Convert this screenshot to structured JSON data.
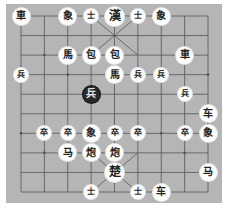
{
  "board": {
    "type": "xiangqi",
    "columns": 9,
    "rows": 10,
    "colors": {
      "board": "#b5b5b5",
      "lines": "#555555",
      "piece_light": "#ffffff",
      "piece_dark": "#2a2a2a"
    }
  },
  "pieces": [
    {
      "label": "車",
      "col": 0,
      "row": 0,
      "style": "normal"
    },
    {
      "label": "象",
      "col": 2,
      "row": 0,
      "style": "normal"
    },
    {
      "label": "士",
      "col": 3,
      "row": 0,
      "style": "small"
    },
    {
      "label": "漢",
      "col": 4,
      "row": 0,
      "style": "big"
    },
    {
      "label": "士",
      "col": 5,
      "row": 0,
      "style": "small"
    },
    {
      "label": "象",
      "col": 6,
      "row": 0,
      "style": "normal"
    },
    {
      "label": "馬",
      "col": 2,
      "row": 2,
      "style": "normal"
    },
    {
      "label": "包",
      "col": 3,
      "row": 2,
      "style": "normal"
    },
    {
      "label": "包",
      "col": 4,
      "row": 2,
      "style": "normal"
    },
    {
      "label": "車",
      "col": 7,
      "row": 2,
      "style": "normal"
    },
    {
      "label": "兵",
      "col": 0,
      "row": 3,
      "style": "small"
    },
    {
      "label": "馬",
      "col": 4,
      "row": 3,
      "style": "normal"
    },
    {
      "label": "兵",
      "col": 5,
      "row": 3,
      "style": "small"
    },
    {
      "label": "兵",
      "col": 6,
      "row": 3,
      "style": "small"
    },
    {
      "label": "兵",
      "col": 3,
      "row": 4,
      "style": "dark"
    },
    {
      "label": "兵",
      "col": 7,
      "row": 4,
      "style": "small"
    },
    {
      "label": "车",
      "col": 8,
      "row": 5,
      "style": "normal"
    },
    {
      "label": "卒",
      "col": 1,
      "row": 6,
      "style": "small"
    },
    {
      "label": "卒",
      "col": 2,
      "row": 6,
      "style": "small"
    },
    {
      "label": "象",
      "col": 3,
      "row": 6,
      "style": "normal"
    },
    {
      "label": "卒",
      "col": 4,
      "row": 6,
      "style": "small"
    },
    {
      "label": "卒",
      "col": 5,
      "row": 6,
      "style": "small"
    },
    {
      "label": "卒",
      "col": 7,
      "row": 6,
      "style": "small"
    },
    {
      "label": "象",
      "col": 8,
      "row": 6,
      "style": "normal"
    },
    {
      "label": "马",
      "col": 2,
      "row": 7,
      "style": "normal"
    },
    {
      "label": "炮",
      "col": 3,
      "row": 7,
      "style": "normal"
    },
    {
      "label": "炮",
      "col": 4,
      "row": 7,
      "style": "normal"
    },
    {
      "label": "楚",
      "col": 4,
      "row": 8,
      "style": "big"
    },
    {
      "label": "马",
      "col": 8,
      "row": 8,
      "style": "normal"
    },
    {
      "label": "士",
      "col": 3,
      "row": 9,
      "style": "small"
    },
    {
      "label": "士",
      "col": 5,
      "row": 9,
      "style": "small"
    },
    {
      "label": "车",
      "col": 6,
      "row": 9,
      "style": "normal"
    }
  ]
}
